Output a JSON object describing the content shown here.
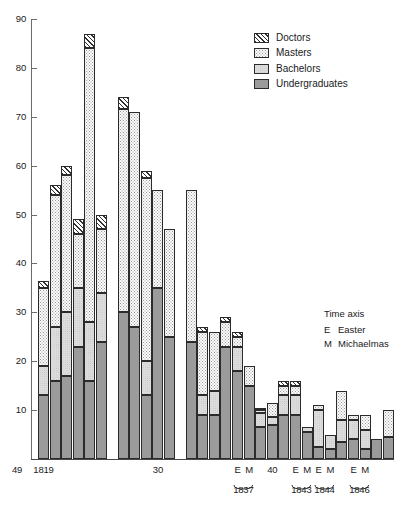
{
  "figure": {
    "kind": "stacked-bar-chart"
  },
  "legend": {
    "position": "top-right",
    "items": [
      {
        "label": "Doctors",
        "key": "doctors",
        "swatch": "diagonal-hatch-swatch",
        "color": "#ffffff"
      },
      {
        "label": "Masters",
        "key": "masters",
        "swatch": "stipple-swatch",
        "color": "#fbfbfb"
      },
      {
        "label": "Bachelors",
        "key": "bachelors",
        "swatch": "light-fill-swatch",
        "color": "#dcdcdc"
      },
      {
        "label": "Undergraduates",
        "key": "undergraduates",
        "swatch": "dark-stipple-swatch",
        "color": "#9b9b9b"
      }
    ]
  },
  "notes": {
    "title": "Time axis",
    "entries": [
      {
        "key": "E",
        "text": "Easter"
      },
      {
        "key": "M",
        "text": "Michaelmas"
      }
    ]
  },
  "yaxis": {
    "ticks": [
      "90",
      "80",
      "70",
      "60",
      "50",
      "40",
      "30",
      "20",
      "10"
    ],
    "min": 0,
    "max": 90,
    "step": 10
  },
  "xaxis": {
    "tick_labels": [
      {
        "text": "1819",
        "bar_index": 0
      },
      {
        "text": "30",
        "bar_index": 9
      },
      {
        "text": "E",
        "bar_index": 15
      },
      {
        "text": "M",
        "bar_index": 16
      },
      {
        "text": "40",
        "bar_index": 18
      },
      {
        "text": "E",
        "bar_index": 20
      },
      {
        "text": "M",
        "bar_index": 21
      },
      {
        "text": "E",
        "bar_index": 22
      },
      {
        "text": "M",
        "bar_index": 23
      },
      {
        "text": "E",
        "bar_index": 25
      },
      {
        "text": "M",
        "bar_index": 26
      },
      {
        "text": "49",
        "bar_index": 29
      }
    ],
    "group_labels": [
      {
        "text": "1837",
        "from": 15,
        "to": 16
      },
      {
        "text": "1843",
        "from": 20,
        "to": 21
      },
      {
        "text": "1844",
        "from": 22,
        "to": 23
      },
      {
        "text": "1846",
        "from": 25,
        "to": 26
      }
    ]
  },
  "chart_data": {
    "type": "bar",
    "stacked": true,
    "title": "",
    "xlabel": "Time axis",
    "ylabel": "",
    "ylim": [
      0,
      90
    ],
    "ytick_step": 10,
    "grid": false,
    "legend_position": "top-right",
    "series": [
      {
        "name": "Undergraduates",
        "values": [
          13,
          16,
          17,
          23,
          16,
          24,
          30,
          27,
          13,
          35,
          25,
          9,
          9,
          23,
          18,
          15,
          6.5,
          7,
          9,
          9,
          5.5,
          2.5,
          3.5,
          2,
          2,
          4.5
        ]
      },
      {
        "name": "Bachelors",
        "values": [
          6,
          11,
          13,
          12,
          12,
          10,
          0,
          0,
          7,
          0,
          0,
          4,
          5,
          0,
          0,
          0,
          3,
          1.5,
          4,
          4,
          1,
          7.5,
          4.5,
          4,
          2,
          0
        ]
      },
      {
        "name": "Masters",
        "values": [
          16,
          27,
          28,
          11,
          51,
          13,
          41.5,
          44,
          47.5,
          24,
          30,
          4.5,
          2,
          5.5,
          7.5,
          4,
          0.5,
          2.5,
          2,
          2,
          0,
          1,
          1,
          3,
          0,
          5.5
        ]
      },
      {
        "name": "Doctors",
        "values": [
          1.5,
          2,
          2,
          3,
          3,
          3,
          2.5,
          0,
          1.5,
          0,
          0,
          0.5,
          0,
          0.5,
          0.5,
          0,
          0.5,
          0.5,
          1,
          1,
          0,
          0,
          0,
          0,
          0,
          0
        ]
      }
    ],
    "bar_labels": [
      "1819",
      "1820",
      "1821",
      "1822",
      "1823",
      "1824",
      "1827",
      "1828",
      "1829",
      "1830",
      "1831",
      "1834",
      "1835",
      "1836 E",
      "1837 M",
      "1838",
      "1839",
      "1840",
      "1843 E",
      "1843 M",
      "1844 E",
      "1844 M",
      "1846 E",
      "1846 M",
      "1848",
      "1849"
    ],
    "bars": [
      {
        "label": "1819",
        "group": 0,
        "undergraduates": 13,
        "bachelors": 6,
        "masters": 16,
        "doctors": 1.5,
        "total": 36.5
      },
      {
        "label": "1820",
        "group": 0,
        "undergraduates": 16,
        "bachelors": 11,
        "masters": 27,
        "doctors": 2,
        "total": 56
      },
      {
        "label": "1821",
        "group": 0,
        "undergraduates": 17,
        "bachelors": 13,
        "masters": 28,
        "doctors": 2,
        "total": 60
      },
      {
        "label": "1822",
        "group": 0,
        "undergraduates": 23,
        "bachelors": 12,
        "masters": 11,
        "doctors": 3,
        "total": 49
      },
      {
        "label": "1823",
        "group": 0,
        "undergraduates": 16,
        "bachelors": 12,
        "masters": 56,
        "doctors": 3,
        "total": 87
      },
      {
        "label": "1824",
        "group": 0,
        "undergraduates": 24,
        "bachelors": 10,
        "masters": 13,
        "doctors": 3,
        "total": 50
      },
      {
        "label": "1827",
        "group": 1,
        "undergraduates": 30,
        "bachelors": 0,
        "masters": 41.5,
        "doctors": 2.5,
        "total": 74
      },
      {
        "label": "1828",
        "group": 1,
        "undergraduates": 27,
        "bachelors": 0,
        "masters": 44,
        "doctors": 0,
        "total": 71
      },
      {
        "label": "1829",
        "group": 1,
        "undergraduates": 13,
        "bachelors": 7,
        "masters": 37.5,
        "doctors": 1.5,
        "total": 59
      },
      {
        "label": "1830",
        "group": 1,
        "undergraduates": 35,
        "bachelors": 0,
        "masters": 20,
        "doctors": 0,
        "total": 55
      },
      {
        "label": "1831",
        "group": 1,
        "undergraduates": 25,
        "bachelors": 0,
        "masters": 22,
        "doctors": 0,
        "total": 47
      },
      {
        "label": "1834",
        "group": 2,
        "undergraduates": 24,
        "bachelors": 0,
        "masters": 31,
        "doctors": 0,
        "total": 55
      },
      {
        "label": "1835",
        "group": 2,
        "undergraduates": 9,
        "bachelors": 4,
        "masters": 13,
        "doctors": 1,
        "total": 46
      },
      {
        "label": "1836",
        "group": 2,
        "undergraduates": 9,
        "bachelors": 5,
        "masters": 12,
        "doctors": 0,
        "total": 26
      },
      {
        "label": "1837 E",
        "group": 2,
        "undergraduates": 23,
        "bachelors": 0,
        "masters": 5,
        "doctors": 1,
        "total": 29
      },
      {
        "label": "1837 M",
        "group": 2,
        "undergraduates": 18,
        "bachelors": 5,
        "masters": 2,
        "doctors": 1,
        "total": 26
      },
      {
        "label": "1838",
        "group": 2,
        "undergraduates": 15,
        "bachelors": 0,
        "masters": 4,
        "doctors": 0,
        "total": 19
      },
      {
        "label": "1839",
        "group": 2,
        "undergraduates": 6.5,
        "bachelors": 3,
        "masters": 0.5,
        "doctors": 0.5,
        "total": 10
      },
      {
        "label": "1840",
        "group": 2,
        "undergraduates": 7,
        "bachelors": 1.5,
        "masters": 3,
        "doctors": 0,
        "total": 11.5
      },
      {
        "label": "1841",
        "group": 2,
        "undergraduates": 9,
        "bachelors": 4,
        "masters": 2,
        "doctors": 1,
        "total": 16
      },
      {
        "label": "1842",
        "group": 2,
        "undergraduates": 9,
        "bachelors": 4,
        "masters": 2,
        "doctors": 1,
        "total": 16
      },
      {
        "label": "1843 E",
        "group": 2,
        "undergraduates": 5.5,
        "bachelors": 1,
        "masters": 0,
        "doctors": 0,
        "total": 6.5
      },
      {
        "label": "1843 M",
        "group": 2,
        "undergraduates": 2.5,
        "bachelors": 7.5,
        "masters": 1,
        "doctors": 0,
        "total": 11
      },
      {
        "label": "1844 E",
        "group": 2,
        "undergraduates": 2,
        "bachelors": 3,
        "masters": 0,
        "doctors": 0,
        "total": 5
      },
      {
        "label": "1844 M",
        "group": 2,
        "undergraduates": 3.5,
        "bachelors": 4.5,
        "masters": 6,
        "doctors": 0,
        "total": 14
      },
      {
        "label": "1846 E",
        "group": 2,
        "undergraduates": 4,
        "bachelors": 4,
        "masters": 1,
        "doctors": 0,
        "total": 9
      },
      {
        "label": "1846 M",
        "group": 2,
        "undergraduates": 2,
        "bachelors": 4,
        "masters": 3,
        "doctors": 0,
        "total": 9
      },
      {
        "label": "1848",
        "group": 2,
        "undergraduates": 4,
        "bachelors": 0,
        "masters": 0,
        "doctors": 0,
        "total": 4
      },
      {
        "label": "1849",
        "group": 2,
        "undergraduates": 4.5,
        "bachelors": 0,
        "masters": 5.5,
        "doctors": 0,
        "total": 10
      }
    ]
  },
  "geometry": {
    "plot_left": 36,
    "plot_baseline_y": 459,
    "plot_top_y": 19,
    "px_per_unit": 4.889,
    "bar_width": 11.0,
    "bar_pitch": 11.6,
    "gaps_after_bar_index": [
      5,
      10
    ],
    "gap_extra_px": 10
  }
}
